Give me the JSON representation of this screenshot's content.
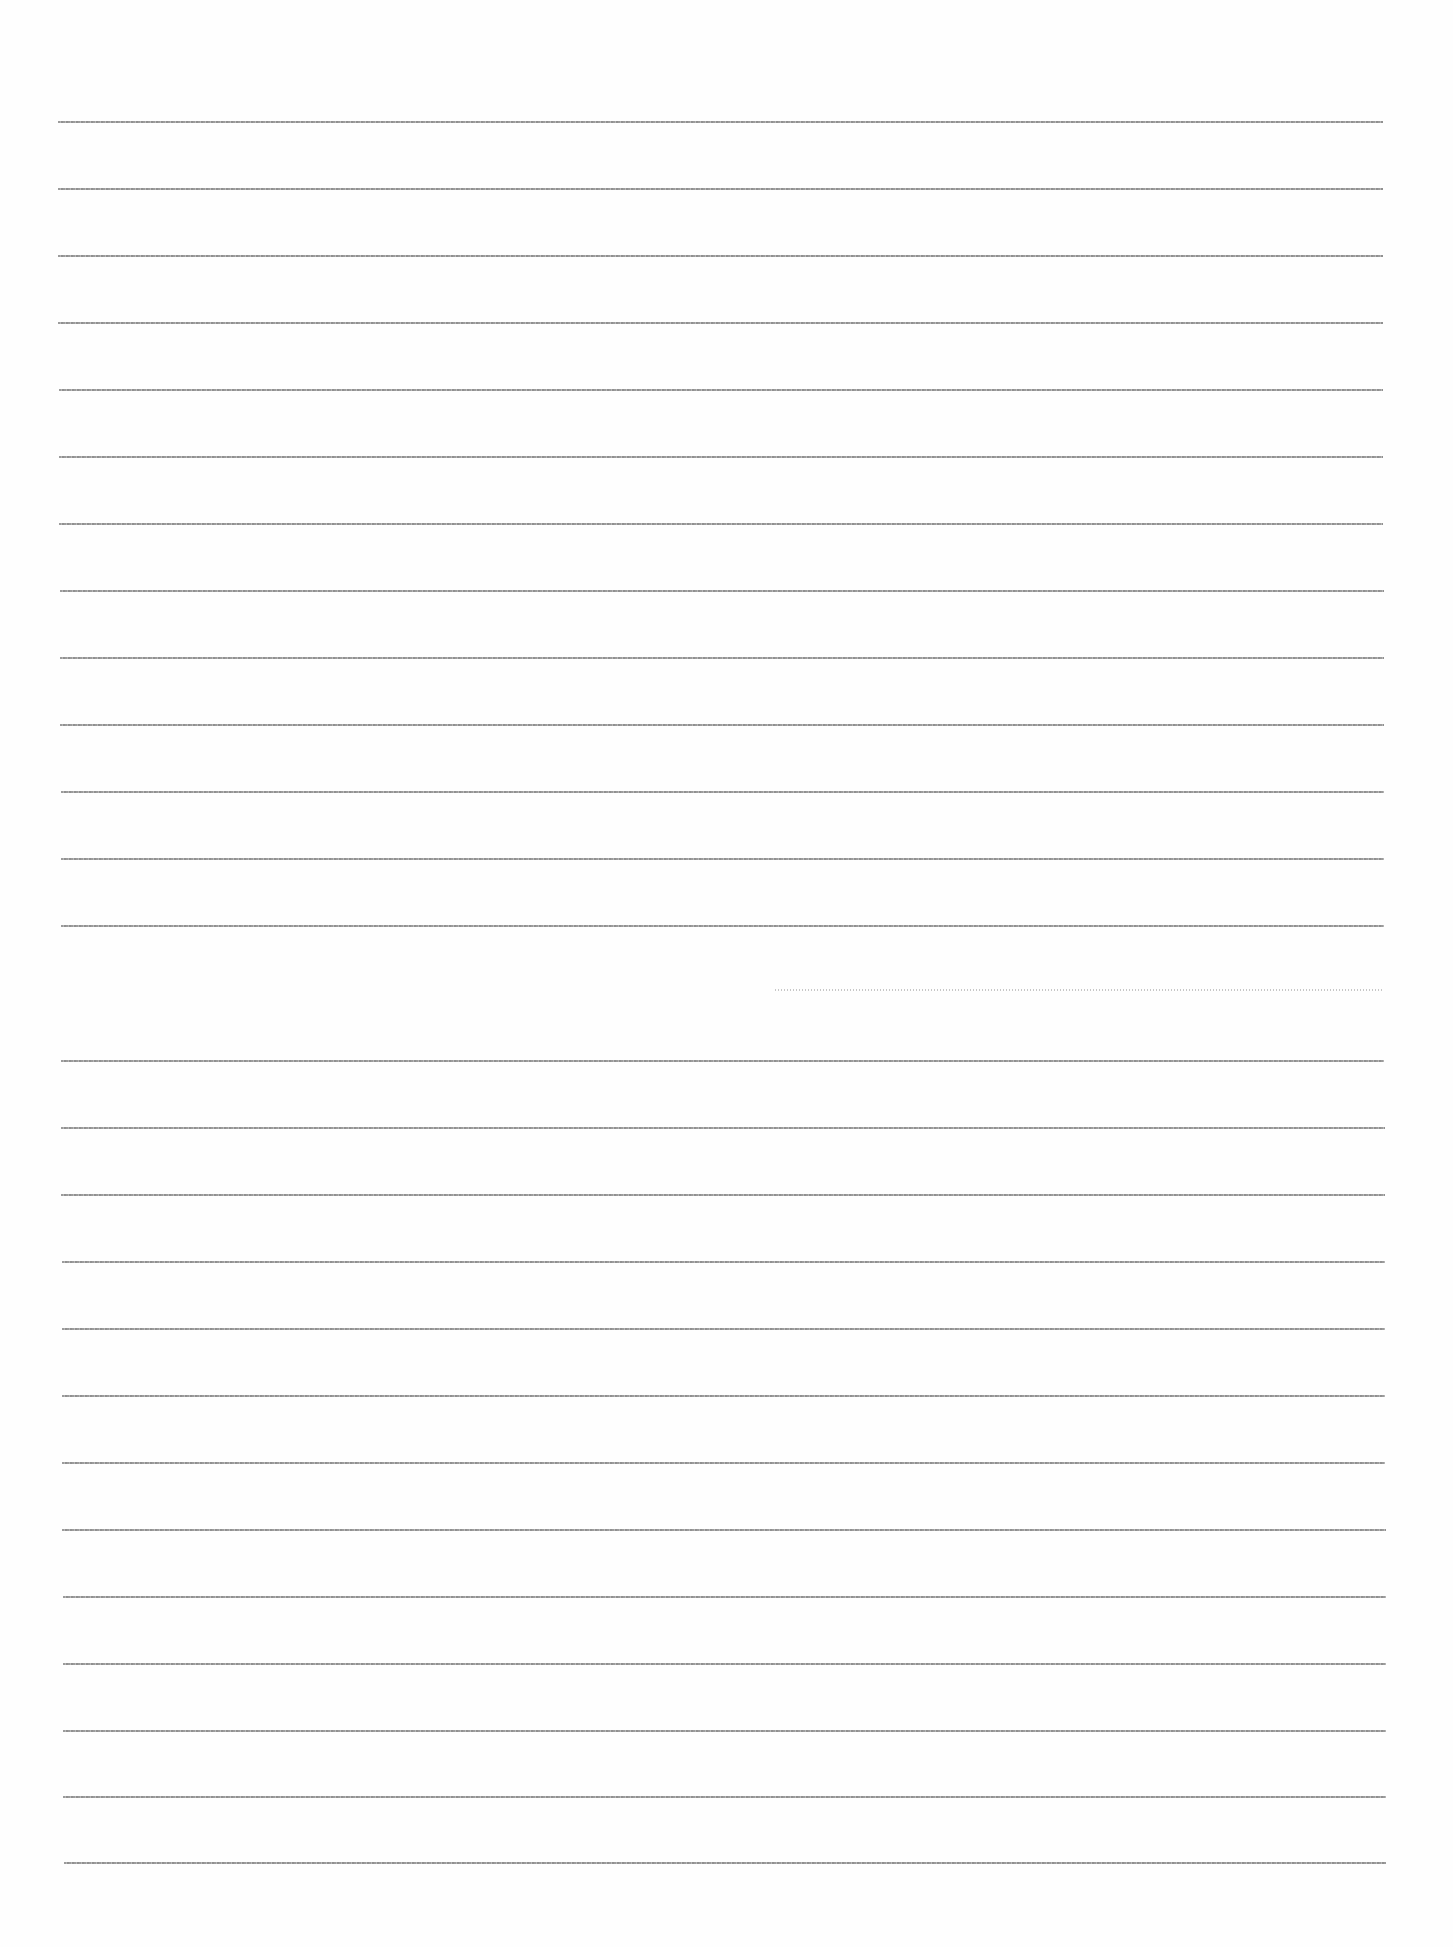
{
  "document": {
    "type": "ruled-paper",
    "background_color": "#fefefe",
    "line_color": "#8a8a8a",
    "line_spacing_px": 67,
    "text": ""
  },
  "lines": [
    {
      "y": 122,
      "x1": 58,
      "x2": 1383
    },
    {
      "y": 189,
      "x1": 58,
      "x2": 1383
    },
    {
      "y": 256,
      "x1": 58,
      "x2": 1383
    },
    {
      "y": 323,
      "x1": 58,
      "x2": 1383
    },
    {
      "y": 390,
      "x1": 59,
      "x2": 1383
    },
    {
      "y": 457,
      "x1": 59,
      "x2": 1383
    },
    {
      "y": 524,
      "x1": 59,
      "x2": 1383
    },
    {
      "y": 591,
      "x1": 60,
      "x2": 1384
    },
    {
      "y": 658,
      "x1": 60,
      "x2": 1384
    },
    {
      "y": 725,
      "x1": 60,
      "x2": 1384
    },
    {
      "y": 792,
      "x1": 61,
      "x2": 1384
    },
    {
      "y": 859,
      "x1": 61,
      "x2": 1384
    },
    {
      "y": 926,
      "x1": 61,
      "x2": 1384
    },
    {
      "y": 990,
      "x1": 775,
      "x2": 1384,
      "faint": true
    },
    {
      "y": 1061,
      "x1": 61,
      "x2": 1384
    },
    {
      "y": 1128,
      "x1": 61,
      "x2": 1385
    },
    {
      "y": 1195,
      "x1": 61,
      "x2": 1385
    },
    {
      "y": 1262,
      "x1": 62,
      "x2": 1385
    },
    {
      "y": 1329,
      "x1": 62,
      "x2": 1385
    },
    {
      "y": 1396,
      "x1": 62,
      "x2": 1385
    },
    {
      "y": 1463,
      "x1": 62,
      "x2": 1385
    },
    {
      "y": 1530,
      "x1": 62,
      "x2": 1386
    },
    {
      "y": 1597,
      "x1": 63,
      "x2": 1386
    },
    {
      "y": 1664,
      "x1": 63,
      "x2": 1386
    },
    {
      "y": 1731,
      "x1": 63,
      "x2": 1386
    },
    {
      "y": 1797,
      "x1": 63,
      "x2": 1386
    },
    {
      "y": 1863,
      "x1": 64,
      "x2": 1386
    }
  ]
}
